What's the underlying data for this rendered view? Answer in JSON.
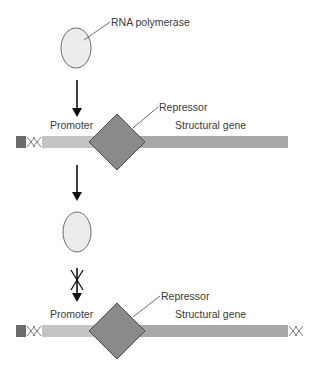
{
  "labels": {
    "rna_polymerase": "RNA polymerase",
    "repressor_top": "Repressor",
    "promoter_top": "Promoter",
    "structural_gene_top": "Structural gene",
    "repressor_bottom": "Repressor",
    "promoter_bottom": "Promoter",
    "structural_gene_bottom": "Structural gene"
  },
  "colors": {
    "polymerase_fill": "#ececec",
    "polymerase_stroke": "#6a6a6a",
    "repressor_fill": "#8a8a8a",
    "repressor_stroke": "#4a4a4a",
    "promoter_fill": "#c4c4c4",
    "gene_fill": "#a8a8a8",
    "dna_end": "#6b6b6b",
    "arrow": "#111111"
  }
}
